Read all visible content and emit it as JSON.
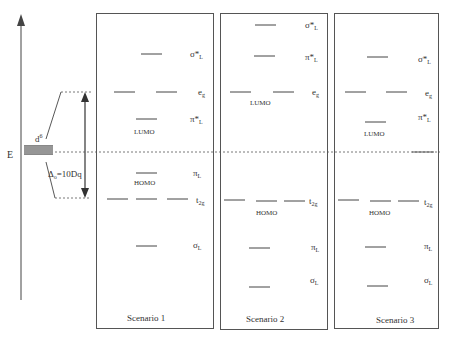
{
  "axis": {
    "label": "E",
    "d_label": "d",
    "d_sup": "6",
    "delta_label": "Δ",
    "delta_sub": "o",
    "delta_eq": "=10Dq"
  },
  "colors": {
    "line": "#444444",
    "box": "#555555",
    "text": "#333333",
    "background": "#ffffff"
  },
  "scenarios": [
    {
      "name": "Scenario 1",
      "levels": {
        "sigma_star_L": {
          "label": "σ*",
          "sub": "L",
          "y": 54
        },
        "e_g": {
          "label": "e",
          "sub": "g",
          "y": 92
        },
        "pi_star_L": {
          "label": "π*",
          "sub": "L",
          "y": 119
        },
        "pi_L": {
          "label": "π",
          "sub": "L",
          "y": 173
        },
        "t_2g": {
          "label": "t",
          "sub": "2g",
          "y": 199
        },
        "sigma_L": {
          "label": "σ",
          "sub": "L",
          "y": 246
        }
      },
      "lumo_label": "LUMO",
      "homo_label": "HOMO"
    },
    {
      "name": "Scenario 2",
      "levels": {
        "sigma_star_L": {
          "label": "σ*",
          "sub": "L",
          "y": 25
        },
        "pi_star_L": {
          "label": "π*",
          "sub": "L",
          "y": 56
        },
        "e_g": {
          "label": "e",
          "sub": "g",
          "y": 92
        },
        "t_2g": {
          "label": "t",
          "sub": "2g",
          "y": 200
        },
        "pi_L": {
          "label": "π",
          "sub": "L",
          "y": 248
        },
        "sigma_L": {
          "label": "σ",
          "sub": "L",
          "y": 287
        }
      },
      "lumo_label": "LUMO",
      "homo_label": "HOMO"
    },
    {
      "name": "Scenario 3",
      "levels": {
        "sigma_star_L": {
          "label": "σ*",
          "sub": "L",
          "y": 57
        },
        "e_g": {
          "label": "e",
          "sub": "g",
          "y": 92
        },
        "pi_star_L": {
          "label": "π*",
          "sub": "L",
          "y": 122
        },
        "t_2g": {
          "label": "t",
          "sub": "2g",
          "y": 200
        },
        "pi_L": {
          "label": "π",
          "sub": "L",
          "y": 247
        },
        "sigma_L": {
          "label": "σ",
          "sub": "L",
          "y": 286
        }
      },
      "lumo_label": "LUMO",
      "homo_label": "HOMO"
    }
  ]
}
